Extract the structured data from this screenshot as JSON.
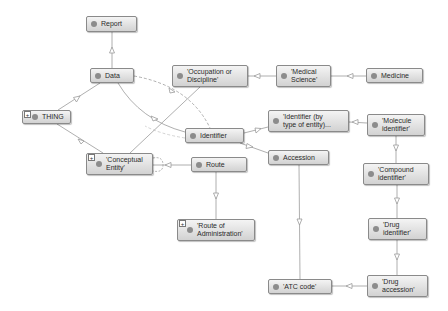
{
  "diagram": {
    "type": "ontology-graph",
    "node_color": "#d9d9d9",
    "dot_color": "#8c8c8c",
    "edge_color": "#9a9a9a",
    "nodes": [
      {
        "id": "report",
        "label": "Report",
        "x": 86,
        "y": 16,
        "w": 51,
        "h": 16,
        "expander": false
      },
      {
        "id": "data",
        "label": "Data",
        "x": 90,
        "y": 68,
        "w": 44,
        "h": 15,
        "expander": false
      },
      {
        "id": "thing",
        "label": "THING",
        "x": 22,
        "y": 110,
        "w": 49,
        "h": 14,
        "expander": true
      },
      {
        "id": "conceptual-entity",
        "label": "'Conceptual\nEntity'",
        "x": 86,
        "y": 153,
        "w": 67,
        "h": 22,
        "expander": true
      },
      {
        "id": "occupation",
        "label": "'Occupation or\nDiscipline'",
        "x": 172,
        "y": 65,
        "w": 76,
        "h": 22,
        "expander": false
      },
      {
        "id": "medical-science",
        "label": "'Medical\nScience'",
        "x": 276,
        "y": 65,
        "w": 55,
        "h": 22,
        "expander": false
      },
      {
        "id": "medicine",
        "label": "Medicine",
        "x": 366,
        "y": 68,
        "w": 57,
        "h": 15,
        "expander": false
      },
      {
        "id": "identifier",
        "label": "Identifier",
        "x": 185,
        "y": 128,
        "w": 59,
        "h": 15,
        "expander": false
      },
      {
        "id": "identifier-by-type",
        "label": "'Identifier (by\ntype of entity)...",
        "x": 268,
        "y": 110,
        "w": 81,
        "h": 22,
        "expander": false
      },
      {
        "id": "molecule-identifier",
        "label": "'Molecule\nidentifier'",
        "x": 367,
        "y": 114,
        "w": 58,
        "h": 22,
        "expander": false
      },
      {
        "id": "accession",
        "label": "Accession",
        "x": 268,
        "y": 150,
        "w": 61,
        "h": 15,
        "expander": false
      },
      {
        "id": "route",
        "label": "Route",
        "x": 191,
        "y": 157,
        "w": 56,
        "h": 15,
        "expander": false
      },
      {
        "id": "route-of-administration",
        "label": "'Route of\nAdministration'",
        "x": 177,
        "y": 219,
        "w": 78,
        "h": 22,
        "expander": true
      },
      {
        "id": "compound-identifier",
        "label": "'Compound\nidentifier'",
        "x": 363,
        "y": 163,
        "w": 66,
        "h": 22,
        "expander": false
      },
      {
        "id": "drug-identifier",
        "label": "'Drug\nidentifier'",
        "x": 368,
        "y": 218,
        "w": 59,
        "h": 22,
        "expander": false
      },
      {
        "id": "atc-code",
        "label": "'ATC code'",
        "x": 268,
        "y": 279,
        "w": 64,
        "h": 15,
        "expander": false
      },
      {
        "id": "drug-accession",
        "label": "'Drug\naccession'",
        "x": 367,
        "y": 275,
        "w": 61,
        "h": 22,
        "expander": false
      }
    ],
    "edges": [
      {
        "from": "data",
        "to": "report",
        "style": "solid"
      },
      {
        "from": "thing",
        "to": "data",
        "style": "solid"
      },
      {
        "from": "thing",
        "to": "conceptual-entity",
        "style": "solid"
      },
      {
        "from": "data",
        "to": "identifier",
        "style": "solid"
      },
      {
        "from": "data",
        "to": "identifier",
        "style": "dashed"
      },
      {
        "from": "conceptual-entity",
        "to": "occupation",
        "style": "solid"
      },
      {
        "from": "conceptual-entity",
        "to": "route",
        "style": "solid"
      },
      {
        "from": "medical-science",
        "to": "occupation",
        "style": "solid"
      },
      {
        "from": "medicine",
        "to": "medical-science",
        "style": "solid"
      },
      {
        "from": "identifier",
        "to": "identifier-by-type",
        "style": "solid"
      },
      {
        "from": "identifier",
        "to": "accession",
        "style": "solid"
      },
      {
        "from": "molecule-identifier",
        "to": "identifier-by-type",
        "style": "solid"
      },
      {
        "from": "molecule-identifier",
        "to": "compound-identifier",
        "style": "solid"
      },
      {
        "from": "compound-identifier",
        "to": "drug-identifier",
        "style": "solid"
      },
      {
        "from": "drug-identifier",
        "to": "drug-accession",
        "style": "solid"
      },
      {
        "from": "drug-accession",
        "to": "atc-code",
        "style": "solid"
      },
      {
        "from": "accession",
        "to": "atc-code",
        "style": "solid"
      },
      {
        "from": "route",
        "to": "route-of-administration",
        "style": "solid"
      }
    ]
  }
}
